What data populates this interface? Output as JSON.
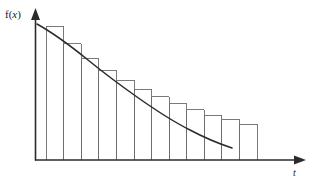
{
  "figure": {
    "title": "",
    "y_axis_label_prefix": "f(",
    "y_axis_label_var": "x",
    "y_axis_label_suffix": ")",
    "y_axis_label": "f(x)",
    "x_axis_label": "t",
    "stroke_color": "#2b2b2b",
    "bar_stroke_color": "#6b6b6b",
    "background_color": "#ffffff"
  },
  "chart_data": {
    "type": "area",
    "title": "",
    "xlabel": "t",
    "ylabel": "f(x)",
    "grid": false,
    "legend": null,
    "xlim": [
      0,
      14.9
    ],
    "ylim": [
      0,
      1.12
    ],
    "curve": {
      "name": "f(x)",
      "kind": "exponential-decay",
      "x": [
        0.0,
        0.9,
        1.8,
        2.7,
        3.6,
        4.5,
        5.4,
        6.3,
        7.2,
        8.1,
        9.0,
        9.9,
        10.8,
        11.7,
        12.6,
        13.5,
        14.2
      ],
      "y": [
        1.12,
        1.0,
        0.885,
        0.785,
        0.7,
        0.625,
        0.56,
        0.503,
        0.452,
        0.408,
        0.369,
        0.334,
        0.303,
        0.276,
        0.251,
        0.23,
        0.216
      ]
    },
    "bars": {
      "count": 12,
      "bar_width": 1.0,
      "x_left": [
        0.6,
        1.6,
        2.6,
        3.6,
        4.6,
        5.6,
        6.6,
        7.6,
        8.6,
        9.6,
        10.6,
        11.6
      ],
      "x_right": [
        1.6,
        2.6,
        3.6,
        4.6,
        5.6,
        6.6,
        7.6,
        8.6,
        9.6,
        10.6,
        11.6,
        12.6
      ],
      "heights": [
        1.0,
        0.868,
        0.758,
        0.672,
        0.596,
        0.53,
        0.472,
        0.421,
        0.376,
        0.336,
        0.3,
        0.268
      ]
    },
    "axes": {
      "x_arrow": true,
      "y_arrow": true,
      "ticks": false,
      "tick_labels": []
    }
  }
}
